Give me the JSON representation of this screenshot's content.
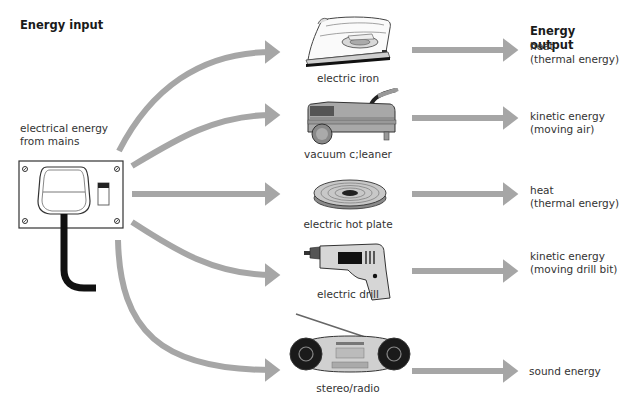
{
  "headings": {
    "input": "Energy input",
    "output": "Energy output"
  },
  "source": {
    "label_line1": "electrical energy",
    "label_line2": "from mains",
    "icon": "mains-socket-plug-icon"
  },
  "devices": [
    {
      "name": "electric iron",
      "icon": "iron-icon",
      "output_line1": "heat",
      "output_line2": "(thermal energy)"
    },
    {
      "name": "vacuum c;leaner",
      "icon": "vacuum-cleaner-icon",
      "output_line1": "kinetic energy",
      "output_line2": "(moving air)"
    },
    {
      "name": "electric hot plate",
      "icon": "hot-plate-icon",
      "output_line1": "heat",
      "output_line2": "(thermal energy)"
    },
    {
      "name": "electric drill",
      "icon": "drill-icon",
      "output_line1": "kinetic energy",
      "output_line2": "(moving drill bit)"
    },
    {
      "name": "stereo/radio",
      "icon": "stereo-radio-icon",
      "output_line1": "sound energy",
      "output_line2": ""
    }
  ],
  "colors": {
    "arrow": "#a6a6a6",
    "text": "#333333",
    "outline": "#333333"
  }
}
